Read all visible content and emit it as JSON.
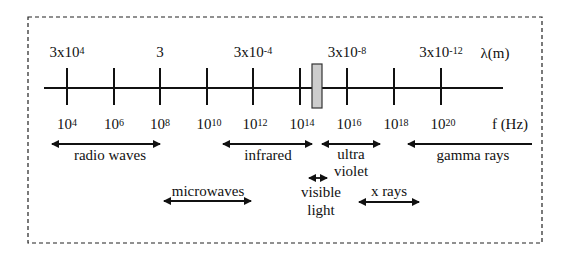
{
  "diagram": {
    "wavelength_axis_label": "λ(m)",
    "frequency_axis_label": "f (Hz)",
    "wavelength_labels": [
      {
        "base": "3x10",
        "exp": "4",
        "x": 67
      },
      {
        "base": "3",
        "exp": "",
        "x": 160
      },
      {
        "base": "3x10",
        "exp": "-4",
        "x": 253
      },
      {
        "base": "3x10",
        "exp": "-8",
        "x": 347
      },
      {
        "base": "3x10",
        "exp": "-12",
        "x": 441
      }
    ],
    "frequency_labels": [
      {
        "base": "10",
        "exp": "4",
        "x": 67
      },
      {
        "base": "10",
        "exp": "6",
        "x": 114
      },
      {
        "base": "10",
        "exp": "8",
        "x": 160
      },
      {
        "base": "10",
        "exp": "10",
        "x": 207
      },
      {
        "base": "10",
        "exp": "12",
        "x": 253
      },
      {
        "base": "10",
        "exp": "14",
        "x": 300
      },
      {
        "base": "10",
        "exp": "16",
        "x": 347
      },
      {
        "base": "10",
        "exp": "18",
        "x": 394
      },
      {
        "base": "10",
        "exp": "20",
        "x": 441
      }
    ],
    "visible_band_color": "#cccccc",
    "bands": {
      "radio": "radio waves",
      "infrared": "infrared",
      "uv_line1": "ultra",
      "uv_line2": "violet",
      "gamma": "gamma rays",
      "microwaves": "microwaves",
      "visible_line1": "visible",
      "visible_line2": "light",
      "xrays": "x rays"
    }
  }
}
